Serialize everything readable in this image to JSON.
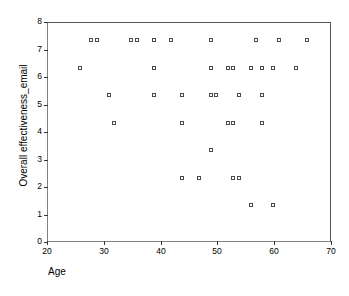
{
  "chart_data": {
    "type": "scatter",
    "title": "",
    "xlabel": "Age",
    "ylabel": "Overall effectiveness_email",
    "xlim": [
      20,
      70
    ],
    "ylim": [
      0,
      8
    ],
    "xticks": [
      20,
      30,
      40,
      50,
      60,
      70
    ],
    "yticks": [
      0,
      1,
      2,
      3,
      4,
      5,
      6,
      7,
      8
    ],
    "grid": false,
    "legend": null,
    "marker": "open-square",
    "marker_color": "#4a4a4a",
    "points": [
      {
        "x": 28,
        "y": 7.3
      },
      {
        "x": 29,
        "y": 7.3
      },
      {
        "x": 35,
        "y": 7.3
      },
      {
        "x": 36,
        "y": 7.3
      },
      {
        "x": 39,
        "y": 7.3
      },
      {
        "x": 42,
        "y": 7.3
      },
      {
        "x": 49,
        "y": 7.3
      },
      {
        "x": 57,
        "y": 7.3
      },
      {
        "x": 61,
        "y": 7.3
      },
      {
        "x": 66,
        "y": 7.3
      },
      {
        "x": 26,
        "y": 6.3
      },
      {
        "x": 39,
        "y": 6.3
      },
      {
        "x": 49,
        "y": 6.3
      },
      {
        "x": 52,
        "y": 6.3
      },
      {
        "x": 53,
        "y": 6.3
      },
      {
        "x": 56,
        "y": 6.3
      },
      {
        "x": 58,
        "y": 6.3
      },
      {
        "x": 60,
        "y": 6.3
      },
      {
        "x": 64,
        "y": 6.3
      },
      {
        "x": 31,
        "y": 5.3
      },
      {
        "x": 39,
        "y": 5.3
      },
      {
        "x": 44,
        "y": 5.3
      },
      {
        "x": 49,
        "y": 5.3
      },
      {
        "x": 50,
        "y": 5.3
      },
      {
        "x": 54,
        "y": 5.3
      },
      {
        "x": 58,
        "y": 5.3
      },
      {
        "x": 32,
        "y": 4.3
      },
      {
        "x": 44,
        "y": 4.3
      },
      {
        "x": 52,
        "y": 4.3
      },
      {
        "x": 53,
        "y": 4.3
      },
      {
        "x": 58,
        "y": 4.3
      },
      {
        "x": 49,
        "y": 3.3
      },
      {
        "x": 44,
        "y": 2.3
      },
      {
        "x": 47,
        "y": 2.3
      },
      {
        "x": 53,
        "y": 2.3
      },
      {
        "x": 54,
        "y": 2.3
      },
      {
        "x": 56,
        "y": 1.3
      },
      {
        "x": 60,
        "y": 1.3
      }
    ]
  },
  "axes": {
    "x_tick_labels": [
      "20",
      "30",
      "40",
      "50",
      "60",
      "70"
    ],
    "y_tick_labels": [
      "0",
      "1",
      "2",
      "3",
      "4",
      "5",
      "6",
      "7",
      "8"
    ],
    "x_title": "Age",
    "y_title": "Overall effectiveness_email"
  }
}
